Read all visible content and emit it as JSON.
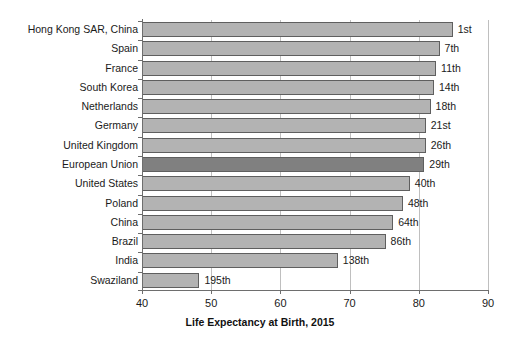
{
  "chart_data": {
    "type": "bar",
    "orientation": "horizontal",
    "title": "",
    "xlabel": "Life Expectancy at Birth, 2015",
    "ylabel": "",
    "xlim": [
      40,
      90
    ],
    "xticks": [
      40,
      50,
      60,
      70,
      80,
      90
    ],
    "grid": true,
    "legend": false,
    "categories": [
      "Hong Kong SAR, China",
      "Spain",
      "France",
      "South Korea",
      "Netherlands",
      "Germany",
      "United Kingdom",
      "European Union",
      "United States",
      "Poland",
      "China",
      "Brazil",
      "India",
      "Swaziland"
    ],
    "values": [
      84.9,
      83.0,
      82.5,
      82.2,
      81.7,
      81.0,
      81.0,
      80.8,
      78.7,
      77.7,
      76.3,
      75.2,
      68.3,
      48.3
    ],
    "annotations": [
      "1st",
      "7th",
      "11th",
      "14th",
      "18th",
      "21st",
      "26th",
      "29th",
      "40th",
      "48th",
      "64th",
      "86th",
      "138th",
      "195th"
    ],
    "highlight_index": 7,
    "colors": {
      "bar": "#b3b3b3",
      "bar_highlight": "#808080",
      "bar_edge": "#5f5f5f",
      "grid": "#bfbfbf",
      "axis": "#6e6e6e",
      "text": "#1a1a1a",
      "background": "#ffffff"
    }
  }
}
